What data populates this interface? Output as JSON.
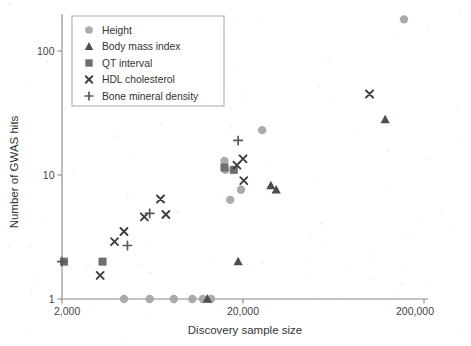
{
  "figure": {
    "background_color": "#ffffff"
  },
  "axes": {
    "x": {
      "label": "Discovery sample size",
      "scale": "log",
      "ticks": [
        {
          "value": 2000,
          "label": "2,000"
        },
        {
          "value": 20000,
          "label": "20,000"
        },
        {
          "value": 200000,
          "label": "200,000"
        }
      ],
      "range": [
        2000,
        200000
      ]
    },
    "y": {
      "label": "Number of GWAS hits",
      "scale": "log",
      "ticks": [
        {
          "value": 1,
          "label": "1"
        },
        {
          "value": 10,
          "label": "10"
        },
        {
          "value": 100,
          "label": "100"
        }
      ],
      "range": [
        1,
        220
      ]
    }
  },
  "legend": {
    "position": "top-left",
    "entries": [
      {
        "label": "Height",
        "marker": "circle",
        "color": "#a6a6a6"
      },
      {
        "label": "Body mass index",
        "marker": "triangle",
        "color": "#4d4d4d"
      },
      {
        "label": "QT interval",
        "marker": "square",
        "color": "#6e6e6e"
      },
      {
        "label": "HDL cholesterol",
        "marker": "cross-x",
        "color": "#3d3d3d"
      },
      {
        "label": "Bone mineral density",
        "marker": "plus",
        "color": "#5a5a5a"
      }
    ]
  },
  "chart_data": {
    "type": "scatter",
    "title": "",
    "xlabel": "Discovery sample size",
    "ylabel": "Number of GWAS hits",
    "xscale": "log",
    "yscale": "log",
    "xlim": [
      2000,
      200000
    ],
    "ylim": [
      1,
      220
    ],
    "grid": false,
    "legend_position": "top-left",
    "series": [
      {
        "name": "Height",
        "marker": "circle",
        "color": "#a6a6a6",
        "points": [
          {
            "x": 4400,
            "y": 1
          },
          {
            "x": 6100,
            "y": 1
          },
          {
            "x": 8300,
            "y": 1
          },
          {
            "x": 10500,
            "y": 1
          },
          {
            "x": 12000,
            "y": 1
          },
          {
            "x": 13300,
            "y": 1
          },
          {
            "x": 15800,
            "y": 13
          },
          {
            "x": 16000,
            "y": 11
          },
          {
            "x": 17000,
            "y": 6.3
          },
          {
            "x": 19500,
            "y": 7.6
          },
          {
            "x": 25500,
            "y": 23
          },
          {
            "x": 155000,
            "y": 180
          }
        ]
      },
      {
        "name": "Body mass index",
        "marker": "triangle",
        "color": "#4d4d4d",
        "points": [
          {
            "x": 12700,
            "y": 1
          },
          {
            "x": 18800,
            "y": 2
          },
          {
            "x": 28500,
            "y": 8.2
          },
          {
            "x": 30500,
            "y": 7.6
          },
          {
            "x": 122000,
            "y": 28
          }
        ]
      },
      {
        "name": "QT interval",
        "marker": "square",
        "color": "#6e6e6e",
        "points": [
          {
            "x": 2050,
            "y": 2
          },
          {
            "x": 3350,
            "y": 2
          },
          {
            "x": 15800,
            "y": 11.5
          },
          {
            "x": 17800,
            "y": 11
          }
        ]
      },
      {
        "name": "HDL cholesterol",
        "marker": "cross-x",
        "color": "#3d3d3d",
        "points": [
          {
            "x": 3250,
            "y": 1.55
          },
          {
            "x": 3900,
            "y": 2.9
          },
          {
            "x": 4400,
            "y": 3.5
          },
          {
            "x": 5700,
            "y": 4.6
          },
          {
            "x": 7000,
            "y": 6.4
          },
          {
            "x": 7500,
            "y": 4.8
          },
          {
            "x": 18500,
            "y": 12
          },
          {
            "x": 20000,
            "y": 13.5
          },
          {
            "x": 20200,
            "y": 9
          },
          {
            "x": 100000,
            "y": 45
          }
        ]
      },
      {
        "name": "Bone mineral density",
        "marker": "plus",
        "color": "#5a5a5a",
        "points": [
          {
            "x": 2000,
            "y": 2
          },
          {
            "x": 4600,
            "y": 2.7
          },
          {
            "x": 6100,
            "y": 4.9
          },
          {
            "x": 18800,
            "y": 19
          }
        ]
      }
    ]
  }
}
